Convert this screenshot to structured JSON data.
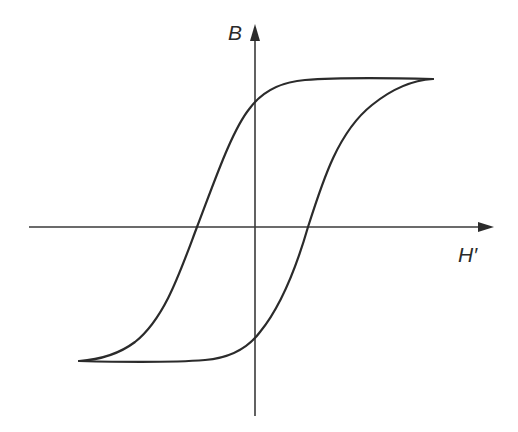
{
  "diagram": {
    "title": "",
    "type": "hysteresis-loop",
    "axes": {
      "x_label": "H′",
      "y_label": "B"
    },
    "colors": {
      "background": "#ffffff",
      "stroke": "#2b2b2b"
    },
    "curves": [
      {
        "name": "ascending-branch",
        "description": "from lower-left saturation up through positive coercive point to upper-right saturation"
      },
      {
        "name": "descending-branch",
        "description": "from upper-right saturation down through negative coercive point to lower-left saturation"
      }
    ]
  }
}
